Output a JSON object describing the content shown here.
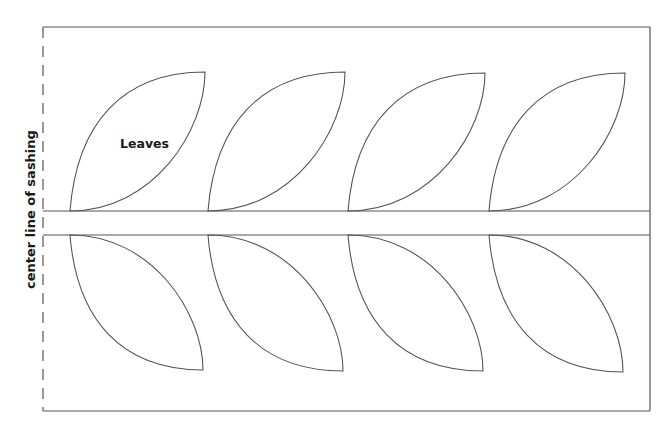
{
  "diagram": {
    "leaf_label": "Leaves",
    "side_label": "center line of sashing",
    "colors": {
      "line": "#555555",
      "text": "#1a1a1a",
      "background": "#ffffff"
    },
    "box": {
      "left": 43,
      "top": 27,
      "right": 650,
      "bottom": 411
    },
    "band": {
      "top": 211,
      "bottom": 235
    },
    "upper_leaves": [
      {
        "base_x": 70,
        "base_y": 211,
        "tip_x": 205,
        "tip_y": 72
      },
      {
        "base_x": 208,
        "base_y": 211,
        "tip_x": 345,
        "tip_y": 72
      },
      {
        "base_x": 348,
        "base_y": 211,
        "tip_x": 485,
        "tip_y": 73
      },
      {
        "base_x": 489,
        "base_y": 211,
        "tip_x": 625,
        "tip_y": 73
      }
    ],
    "lower_leaves": [
      {
        "base_x": 70,
        "base_y": 235,
        "tip_x": 203,
        "tip_y": 370
      },
      {
        "base_x": 208,
        "base_y": 235,
        "tip_x": 343,
        "tip_y": 371
      },
      {
        "base_x": 348,
        "base_y": 235,
        "tip_x": 483,
        "tip_y": 371
      },
      {
        "base_x": 489,
        "base_y": 235,
        "tip_x": 623,
        "tip_y": 372
      }
    ]
  }
}
